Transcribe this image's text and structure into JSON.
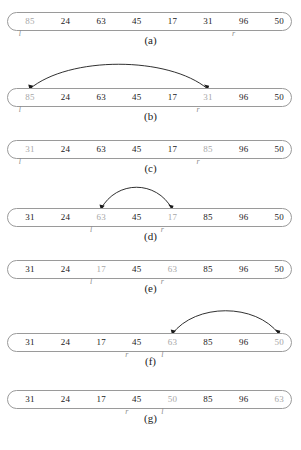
{
  "figure": {
    "cell_count": 8,
    "marker_labels": {
      "left": "l",
      "right": "r"
    },
    "colors": {
      "capsule_border": "#9a9a9a",
      "value_normal": "#1a1a1a",
      "value_highlight": "#a7a7a7",
      "marker": "#8c8c8c",
      "arrow": "#1a1a1a",
      "background": "#ffffff"
    },
    "panels": [
      {
        "caption": "(a)",
        "values": [
          "85",
          "24",
          "63",
          "45",
          "17",
          "31",
          "96",
          "50"
        ],
        "highlighted": [
          0
        ],
        "markers": {
          "l": 0,
          "r": 6
        },
        "arrow": null
      },
      {
        "caption": "(b)",
        "values": [
          "85",
          "24",
          "63",
          "45",
          "17",
          "31",
          "96",
          "50"
        ],
        "highlighted": [
          0,
          5
        ],
        "markers": {
          "l": 0,
          "r": 5
        },
        "arrow": {
          "from": 0,
          "to": 5,
          "height": 30
        }
      },
      {
        "caption": "(c)",
        "values": [
          "31",
          "24",
          "63",
          "45",
          "17",
          "85",
          "96",
          "50"
        ],
        "highlighted": [
          0,
          5
        ],
        "markers": {
          "l": 0,
          "r": 5
        },
        "arrow": null
      },
      {
        "caption": "(d)",
        "values": [
          "31",
          "24",
          "63",
          "45",
          "17",
          "85",
          "96",
          "50"
        ],
        "highlighted": [
          2,
          4
        ],
        "markers": {
          "l": 2,
          "r": 4
        },
        "arrow": {
          "from": 2,
          "to": 4,
          "height": 26
        }
      },
      {
        "caption": "(e)",
        "values": [
          "31",
          "24",
          "17",
          "45",
          "63",
          "85",
          "96",
          "50"
        ],
        "highlighted": [
          2,
          4
        ],
        "markers": {
          "l": 2,
          "r": 4
        },
        "arrow": null
      },
      {
        "caption": "(f)",
        "values": [
          "31",
          "24",
          "17",
          "45",
          "63",
          "85",
          "96",
          "50"
        ],
        "highlighted": [
          4,
          7
        ],
        "markers": {
          "r": 3,
          "l": 4
        },
        "arrow": {
          "from": 4,
          "to": 7,
          "height": 28
        }
      },
      {
        "caption": "(g)",
        "values": [
          "31",
          "24",
          "17",
          "45",
          "50",
          "85",
          "96",
          "63"
        ],
        "highlighted": [
          4,
          7
        ],
        "markers": {
          "r": 3,
          "l": 4
        },
        "arrow": null
      }
    ]
  }
}
